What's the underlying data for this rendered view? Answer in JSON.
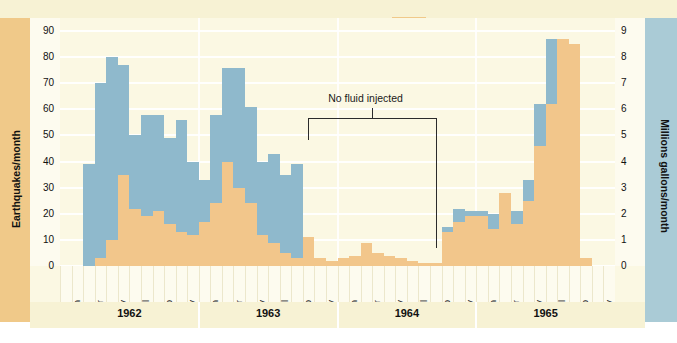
{
  "legend": {
    "items": [
      {
        "label": "Earthquake frequency",
        "color": "#f0c989",
        "swatch": "eq"
      },
      {
        "label": "Contaminated waste injected",
        "color": "#8fb9cc",
        "swatch": "waste"
      }
    ]
  },
  "annotation": {
    "no_fluid_label": "No fluid injected"
  },
  "axes": {
    "left_title": "Earthquakes/month",
    "right_title": "Millions gallons/month",
    "left_ticks": [
      "0",
      "10",
      "20",
      "30",
      "40",
      "50",
      "60",
      "70",
      "80",
      "90"
    ],
    "right_ticks": [
      "0",
      "1",
      "2",
      "3",
      "4",
      "5",
      "6",
      "7",
      "8",
      "9"
    ]
  },
  "years": [
    "1962",
    "1963",
    "1964",
    "1965"
  ],
  "month_labels": [
    "Jan",
    "Mar",
    "May",
    "Jul",
    "Sep",
    "Nov"
  ],
  "chart_data": {
    "type": "bar",
    "title": "",
    "subtitle": "",
    "xlabel": "",
    "ylabel": "Earthquakes/month",
    "y2label": "Millions gallons/month",
    "ylim": [
      0,
      95
    ],
    "y2lim": [
      0,
      9.5
    ],
    "grid": true,
    "legend_position": "top-right",
    "overlay_mode": "overlapping-bars",
    "annotations": [
      {
        "text": "No fluid injected",
        "start_month": "1963-10",
        "end_month": "1964-09"
      }
    ],
    "x": [
      "1962-01",
      "1962-02",
      "1962-03",
      "1962-04",
      "1962-05",
      "1962-06",
      "1962-07",
      "1962-08",
      "1962-09",
      "1962-10",
      "1962-11",
      "1962-12",
      "1963-01",
      "1963-02",
      "1963-03",
      "1963-04",
      "1963-05",
      "1963-06",
      "1963-07",
      "1963-08",
      "1963-09",
      "1963-10",
      "1963-11",
      "1963-12",
      "1964-01",
      "1964-02",
      "1964-03",
      "1964-04",
      "1964-05",
      "1964-06",
      "1964-07",
      "1964-08",
      "1964-09",
      "1964-10",
      "1964-11",
      "1964-12",
      "1965-01",
      "1965-02",
      "1965-03",
      "1965-04",
      "1965-05",
      "1965-06",
      "1965-07",
      "1965-08",
      "1965-09",
      "1965-10",
      "1965-11",
      "1965-12"
    ],
    "series": [
      {
        "name": "Contaminated waste injected",
        "units": "millions gallons/month",
        "color": "#8fb9cc",
        "axis": "right",
        "values": [
          0,
          0,
          3.9,
          7.0,
          8.0,
          7.7,
          5.0,
          5.8,
          5.8,
          4.9,
          5.6,
          4.0,
          3.3,
          5.8,
          7.6,
          7.6,
          6.1,
          4.0,
          4.3,
          3.5,
          3.9,
          1.1,
          0,
          0,
          0,
          0,
          0,
          0,
          0,
          0,
          0,
          0,
          0,
          1.5,
          2.2,
          2.1,
          2.1,
          2.0,
          1.7,
          2.1,
          3.3,
          6.2,
          8.7,
          5.0,
          0,
          0,
          0,
          0
        ]
      },
      {
        "name": "Earthquake frequency",
        "units": "earthquakes/month",
        "color": "#f2c68b",
        "axis": "left",
        "values": [
          0,
          0,
          0,
          3,
          10,
          35,
          22,
          19,
          21,
          16,
          13,
          12,
          17,
          24,
          40,
          30,
          24,
          12,
          9,
          5,
          3,
          11,
          3,
          2,
          3,
          4,
          9,
          5,
          4,
          3,
          2,
          1,
          1,
          13,
          17,
          19,
          19,
          14,
          28,
          16,
          25,
          46,
          62,
          87,
          85,
          3,
          0,
          0
        ]
      }
    ]
  }
}
